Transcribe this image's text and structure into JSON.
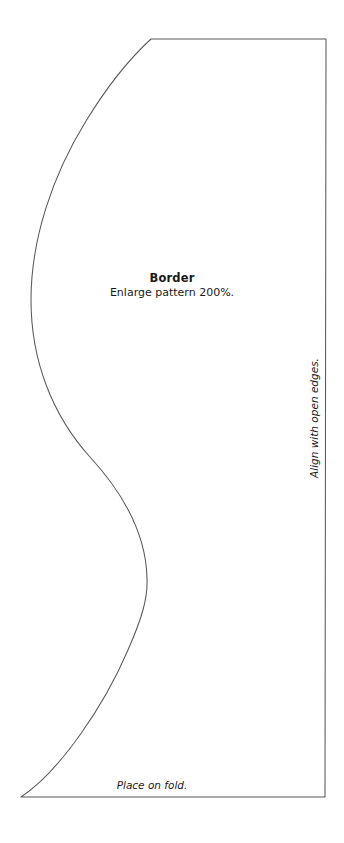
{
  "document": {
    "kind": "sewing-pattern-template",
    "page_background": "#ffffff",
    "line_color": "#58595b",
    "text_color": "#1a1a1a"
  },
  "pattern": {
    "title": "Border",
    "instruction": "Enlarge pattern 200%.",
    "fold_note": "Place on fold.",
    "edge_note": "Align with open edges.",
    "outline": {
      "top_edge": {
        "from": [
          151,
          39
        ],
        "to": [
          326,
          39
        ]
      },
      "right_edge": {
        "from": [
          326,
          39
        ],
        "to": [
          325,
          797
        ]
      },
      "bottom_edge": {
        "from": [
          325,
          797
        ],
        "to": [
          21,
          797
        ]
      },
      "curve_left_side": {
        "type": "s-curve",
        "start": [
          21,
          797
        ],
        "end": [
          151,
          39
        ],
        "control_points": [
          [
            95,
            742
          ],
          [
            147,
            620
          ],
          [
            147,
            578
          ],
          [
            147,
            500
          ],
          [
            64,
            420
          ],
          [
            31,
            288
          ],
          [
            31,
            210
          ],
          [
            86,
            104
          ]
        ]
      }
    }
  }
}
